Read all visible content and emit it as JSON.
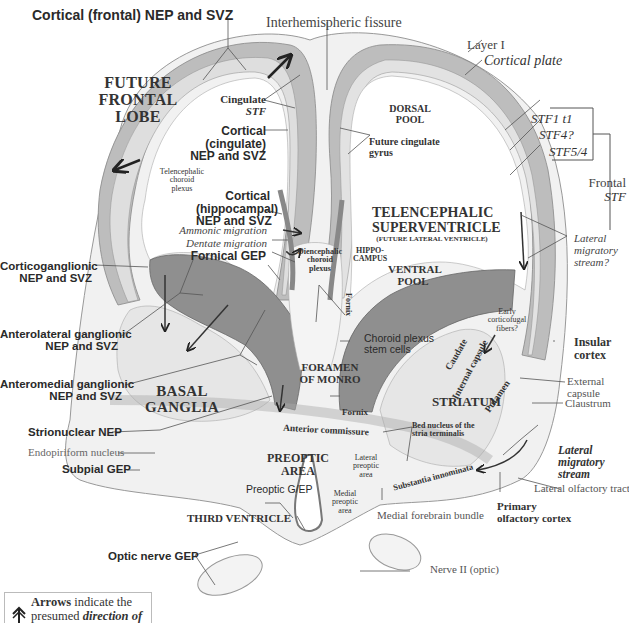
{
  "diagram": {
    "title_top": "Cortical (frontal) NEP and SVZ",
    "regions": {
      "future_frontal_lobe": [
        "FUTURE",
        "FRONTAL",
        "LOBE"
      ],
      "dorsal_pool": [
        "DORSAL",
        "POOL"
      ],
      "telencephalic_superventricle": [
        "TELENCEPHALIC",
        "SUPERVENTRICLE"
      ],
      "future_lateral_ventricle": "(FUTURE LATERAL VENTRICLE)",
      "ventral_pool": [
        "VENTRAL",
        "POOL"
      ],
      "hippocampus": [
        "HIPPO-",
        "CAMPUS"
      ],
      "foramen_of_monro": [
        "FORAMEN",
        "OF MONRO"
      ],
      "basal_ganglia": [
        "BASAL",
        "GANGLIA"
      ],
      "striatum": "STRIATUM",
      "preoptic_area": [
        "PREOPTIC",
        "AREA"
      ],
      "third_ventricle": "THIRD VENTRICLE",
      "caudate": "Caudate",
      "internal_capsule": "Internal capsule",
      "putamen": "Putamen",
      "fornix_vertical": "Fornix",
      "substantia_innominata": "Substantia innominata",
      "anterior_commissure": "Anterior commissure"
    },
    "left_labels": {
      "corticoganglionic": [
        "Corticoganglionic",
        "NEP and SVZ"
      ],
      "anterolateral": [
        "Anterolateral ganglionic",
        "NEP and SVZ"
      ],
      "anteromedial": [
        "Anteromedial ganglionic",
        "NEP and SVZ"
      ],
      "strionuclear": "Strionuclear NEP",
      "endopiriform": "Endopiriform nucleus",
      "subpial": "Subpial GEP",
      "optic_nerve_gep": "Optic nerve GEP"
    },
    "center_labels": {
      "interhemispheric_fissure": "Interhemispheric fissure",
      "cingulate": "Cingulate",
      "cingulate_stf": "STF",
      "cortical_cingulate": [
        "Cortical",
        "(cingulate)",
        "NEP and SVZ"
      ],
      "telencephalic_choroid": [
        "Telencephalic",
        "choroid",
        "plexus"
      ],
      "cortical_hippocampal": [
        "Cortical",
        "(hippocampal)",
        "NEP and SVZ"
      ],
      "ammonic_migration": "Ammonic migration",
      "dentate_migration": "Dentate migration",
      "fornical_gep": "Fornical GEP",
      "diencephalic_choroid": [
        "Diencephalic",
        "choroid",
        "plexus"
      ],
      "choroid_stem_cells": [
        "Choroid plexus",
        "stem cells"
      ],
      "fornix": "Fornix",
      "bed_nucleus": [
        "Bed nucleus of the",
        "stria terminalis"
      ],
      "lateral_preoptic": [
        "Lateral",
        "preoptic",
        "area"
      ],
      "medial_preoptic": [
        "Medial",
        "preoptic",
        "area"
      ],
      "preoptic_gep": "Preoptic G/EP",
      "medial_forebrain_bundle": "Medial forebrain bundle",
      "future_cingulate_gyrus": [
        "Future cingulate",
        "gyrus"
      ]
    },
    "right_labels": {
      "layer_i": "Layer I",
      "cortical_plate": "Cortical plate",
      "stf1": "STF1 t1",
      "stf4": "STF4?",
      "stf54": "STF5/4",
      "frontal": "Frontal",
      "frontal_stf": "STF",
      "lateral_migratory_q": [
        "Lateral",
        "migratory",
        "stream?"
      ],
      "early_corticofugal": [
        "Early",
        "corticofugal",
        "fibers?"
      ],
      "insular_cortex": [
        "Insular",
        "cortex"
      ],
      "external_capsule": [
        "External",
        "capsule"
      ],
      "claustrum": "Claustrum",
      "lateral_migratory": [
        "Lateral",
        "migratory",
        "stream"
      ],
      "lateral_olfactory_tract": "Lateral olfactory tract",
      "primary_olfactory": [
        "Primary",
        "olfactory cortex"
      ],
      "nerve_ii": "Nerve II (optic)"
    },
    "legend": {
      "icon": "double-arrow-up-icon",
      "bold_word": "Arrows",
      "line1_rest": " indicate the",
      "line2_plain": "presumed ",
      "line2_emph": "direction of"
    },
    "colors": {
      "background": "#ffffff",
      "neuroepithelium_dark": "#8a8a8a",
      "cortex_mid": "#b5b5b5",
      "tissue_light": "#e4e4e4",
      "tissue_lighter": "#efefef",
      "line": "#555555",
      "text": "#2a2a2a"
    }
  }
}
